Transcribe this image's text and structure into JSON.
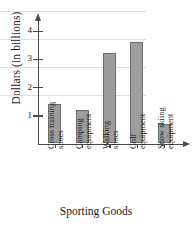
{
  "chart_data": {
    "type": "bar",
    "title": "",
    "xlabel": "Sporting Goods",
    "ylabel": "Dollars (in billions)",
    "categories": [
      "Cross training shoes",
      "Camping equipment",
      "Walking shoes",
      "Golf equipment",
      "Snow skiing equipment"
    ],
    "category_lines": [
      [
        "Cross training",
        "shoes"
      ],
      [
        "Camping",
        "equipment"
      ],
      [
        "Walking",
        "shoes"
      ],
      [
        "Golf",
        "equipment"
      ],
      [
        "Snow skiing",
        "equipment"
      ]
    ],
    "values": [
      1.4,
      1.2,
      3.2,
      3.6,
      0.7
    ],
    "ylim": [
      0,
      4.4
    ],
    "yticks": [
      1,
      2,
      3,
      4
    ],
    "ytick_labels": [
      "1",
      "2",
      "3",
      "4"
    ],
    "grid": true,
    "legend": false,
    "bar_color": "#9d9d9d",
    "bar_edge_color": "#6d6d6d",
    "axis_color": "#4a4a4a",
    "gridline_color": "#dedede"
  }
}
